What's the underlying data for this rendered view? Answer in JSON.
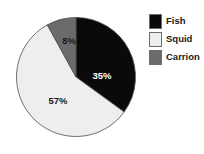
{
  "chart_data": {
    "type": "pie",
    "title": "",
    "categories": [
      "Fish",
      "Squid",
      "Carrion"
    ],
    "values": [
      35,
      57,
      8
    ],
    "labels": [
      "35%",
      "57%",
      "8%"
    ],
    "unit": "%",
    "start_angle_deg": 0,
    "direction": "clockwise",
    "legend_position": "right",
    "grid": false,
    "colors": {
      "fish": "#0a0a0a",
      "squid": "#eeeeee",
      "carrion": "#6b6b6b",
      "outline": "#4d4d4d",
      "background": "#ffffff",
      "label_on_dark": "#ffffff",
      "label_on_light": "#1a1a1a",
      "legend_text": "#1a1a1a"
    },
    "slices": [
      {
        "name": "Fish",
        "value": 35,
        "label": "35%",
        "color": "#0a0a0a",
        "label_color": "#ffffff",
        "label_x": 86,
        "label_y": 59
      },
      {
        "name": "Squid",
        "value": 57,
        "label": "57%",
        "color": "#eeeeee",
        "label_color": "#1a1a1a",
        "label_x": 42,
        "label_y": 84
      },
      {
        "name": "Carrion",
        "value": 8,
        "label": "8%",
        "color": "#6b6b6b",
        "label_color": "#1a1a1a",
        "label_x": 53,
        "label_y": 24
      }
    ]
  },
  "legend": {
    "items": [
      {
        "label": "Fish",
        "color": "#0a0a0a"
      },
      {
        "label": "Squid",
        "color": "#eeeeee"
      },
      {
        "label": "Carrion",
        "color": "#6b6b6b"
      }
    ]
  }
}
